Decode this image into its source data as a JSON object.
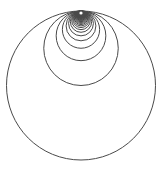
{
  "diagram": {
    "title": "",
    "circle_count": 40,
    "radius_rule": "R/n",
    "stroke_color": "#4a4a4a",
    "background_color": "#ffffff",
    "tangent_point_marker_color": "#ffffff"
  }
}
